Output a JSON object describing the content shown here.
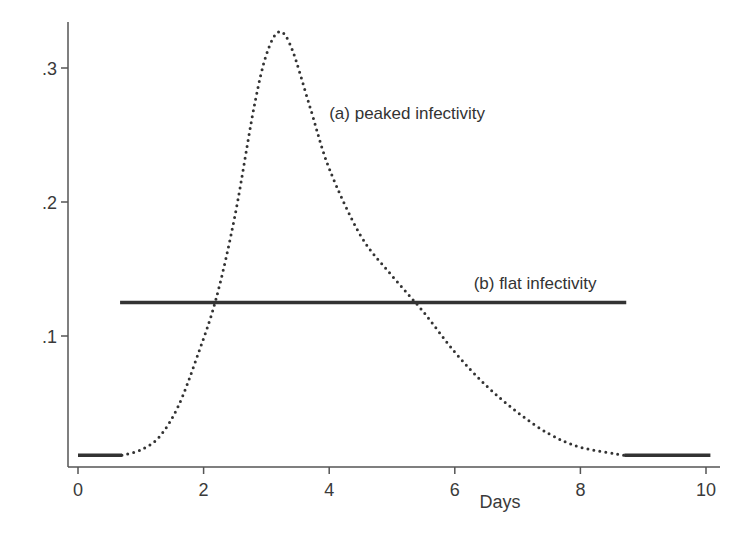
{
  "chart_data": {
    "type": "line",
    "title": "",
    "xlabel": "Days",
    "ylabel": "",
    "xlim": [
      0,
      10
    ],
    "ylim": [
      0,
      0.33
    ],
    "grid": false,
    "legend": null,
    "x_ticks": [
      {
        "value": 0,
        "label": "0"
      },
      {
        "value": 2,
        "label": "2"
      },
      {
        "value": 4,
        "label": "4"
      },
      {
        "value": 6,
        "label": "6"
      },
      {
        "value": 8,
        "label": "8"
      },
      {
        "value": 10,
        "label": "10"
      }
    ],
    "y_ticks": [
      {
        "value": 0.1,
        "label": ".1"
      },
      {
        "value": 0.2,
        "label": ".2"
      },
      {
        "value": 0.3,
        "label": ".3"
      }
    ],
    "series": [
      {
        "name": "(a) peaked infectivity",
        "style": "dotted",
        "x": [
          0.7,
          1.0,
          1.3,
          1.6,
          1.9,
          2.2,
          2.5,
          2.8,
          3.0,
          3.2,
          3.4,
          3.7,
          4.0,
          4.5,
          5.0,
          5.5,
          6.0,
          6.5,
          7.0,
          7.5,
          8.0,
          8.7
        ],
        "values": [
          0.011,
          0.015,
          0.025,
          0.048,
          0.085,
          0.128,
          0.19,
          0.27,
          0.31,
          0.327,
          0.315,
          0.27,
          0.225,
          0.175,
          0.145,
          0.118,
          0.088,
          0.063,
          0.043,
          0.027,
          0.017,
          0.011
        ]
      },
      {
        "name": "(b) flat infectivity",
        "style": "solid",
        "x": [
          0.67,
          8.73
        ],
        "values": [
          0.125,
          0.125
        ]
      },
      {
        "name": "baseline-left",
        "style": "solid",
        "x": [
          0.0,
          0.7
        ],
        "values": [
          0.011,
          0.011
        ]
      },
      {
        "name": "baseline-right",
        "style": "solid",
        "x": [
          8.7,
          10.07
        ],
        "values": [
          0.011,
          0.011
        ]
      }
    ],
    "annotations": [
      {
        "text": "(a) peaked infectivity",
        "x": 4.0,
        "y": 0.262
      },
      {
        "text": "(b) flat infectivity",
        "x": 6.3,
        "y": 0.135
      }
    ]
  },
  "colors": {
    "axis": "#555555",
    "line": "#333333",
    "text": "#333333"
  }
}
